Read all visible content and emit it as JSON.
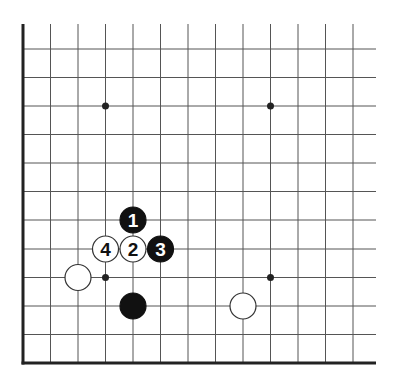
{
  "diagram": {
    "type": "go-board-corner",
    "grid": {
      "x_lines": [
        23,
        50.5,
        78,
        105.5,
        133,
        160.5,
        188,
        215.5,
        243,
        270.5,
        298,
        325.5,
        353
      ],
      "y_lines": [
        49,
        77.5,
        106,
        134.5,
        163,
        191.5,
        220,
        249,
        277.5,
        306,
        334.5,
        363
      ],
      "left_edge_x": 23,
      "bottom_edge_y": 363,
      "top_y": 24,
      "right_x": 376,
      "line_color": "#555555",
      "edge_color": "#222222"
    },
    "star_points": [
      {
        "x": 105.5,
        "y": 106
      },
      {
        "x": 270.5,
        "y": 106
      },
      {
        "x": 105.5,
        "y": 277.5
      },
      {
        "x": 270.5,
        "y": 277.5
      }
    ],
    "stones": [
      {
        "color": "black",
        "x": 133,
        "y": 220,
        "label": "1"
      },
      {
        "color": "white",
        "x": 133,
        "y": 249,
        "label": "2"
      },
      {
        "color": "black",
        "x": 160.5,
        "y": 249,
        "label": "3"
      },
      {
        "color": "white",
        "x": 105.5,
        "y": 249,
        "label": "4"
      },
      {
        "color": "white",
        "x": 78,
        "y": 277.5,
        "label": ""
      },
      {
        "color": "black",
        "x": 133,
        "y": 306,
        "label": ""
      },
      {
        "color": "white",
        "x": 243,
        "y": 306,
        "label": ""
      }
    ],
    "colors": {
      "black_stone": "#111111",
      "white_stone": "#ffffff",
      "white_stone_border": "#333333",
      "black_label": "#ffffff",
      "white_label": "#111111"
    }
  }
}
